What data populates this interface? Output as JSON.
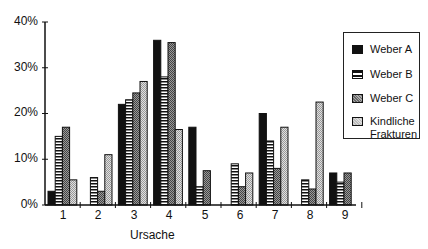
{
  "chart_data": {
    "type": "bar",
    "title": "",
    "xlabel": "Ursache",
    "ylabel": "",
    "ylim": [
      0,
      40
    ],
    "yticks": [
      "0%",
      "10%",
      "20%",
      "30%",
      "40%"
    ],
    "categories": [
      "1",
      "2",
      "3",
      "4",
      "5",
      "6",
      "7",
      "8",
      "9"
    ],
    "series": [
      {
        "name": "Weber A",
        "values": [
          3,
          0,
          22,
          36,
          17,
          0,
          20,
          0,
          7
        ]
      },
      {
        "name": "Weber B",
        "values": [
          15,
          6,
          23,
          28,
          4,
          9,
          14,
          5.5,
          5
        ]
      },
      {
        "name": "Weber C",
        "values": [
          17,
          3,
          24.5,
          35.5,
          7.5,
          4,
          8,
          3.5,
          7
        ]
      },
      {
        "name": "Kindliche Frakturen",
        "values": [
          5.5,
          11,
          27,
          16.5,
          0,
          7,
          17,
          22.5,
          0
        ]
      }
    ],
    "legend_position": "right",
    "grid": false
  },
  "legend": {
    "items": [
      {
        "label": "Weber A"
      },
      {
        "label": "Weber B"
      },
      {
        "label": "Weber C"
      },
      {
        "label_line1": "Kindliche",
        "label_line2": "Frakturen"
      }
    ]
  },
  "axis": {
    "y_labels": [
      "40%",
      "30%",
      "20%",
      "10%",
      "0%"
    ],
    "x_labels": [
      "1",
      "2",
      "3",
      "4",
      "5",
      "6",
      "7",
      "8",
      "9"
    ],
    "x_title": "Ursache"
  }
}
